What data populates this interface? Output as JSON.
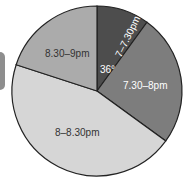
{
  "chart_data": {
    "type": "pie",
    "title": "",
    "start_angle_deg": 0,
    "direction": "clockwise",
    "categories": [
      "7–7.30pm",
      "7.30–8pm",
      "8–8.30pm",
      "8.30–9pm"
    ],
    "values_deg": [
      36,
      90,
      162,
      72
    ],
    "values_pct": [
      10,
      25,
      45,
      20
    ],
    "colors": [
      "#4d4d4d",
      "#7d7d7d",
      "#d6d6d6",
      "#ababab"
    ],
    "label_colors": [
      "#ffffff",
      "#ffffff",
      "#333333",
      "#333333"
    ],
    "annotations": [
      {
        "text": "36°",
        "sector": "7–7.30pm"
      }
    ],
    "legend": "none"
  },
  "labels": {
    "s0": "7–7.30pm",
    "s1": "7.30–8pm",
    "s2": "8–8.30pm",
    "s3": "8.30–9pm",
    "angle": "36°"
  }
}
